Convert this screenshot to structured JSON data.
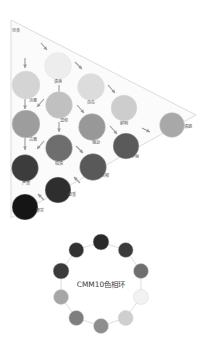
{
  "tone_triangle": {
    "apex_label": "轻柔",
    "axis_note": "",
    "tones": [
      {
        "id": "qingshuang",
        "label": "清爽",
        "color": "#ededed",
        "cx": 58,
        "cy": 66,
        "r": 13.5,
        "lx": 58,
        "ly": 83
      },
      {
        "id": "dan-ya",
        "label": "淡雅",
        "color": "#d4d4d4",
        "cx": 26,
        "cy": 85,
        "r": 14.0,
        "lx": 33,
        "ly": 102
      },
      {
        "id": "zi-zai",
        "label": "自在",
        "color": "#dcdcdc",
        "cx": 91,
        "cy": 87,
        "r": 13.5,
        "lx": 91,
        "ly": 104
      },
      {
        "id": "wen-he",
        "label": "温和",
        "color": "#c0c0c0",
        "cx": 59,
        "cy": 105,
        "r": 13.5,
        "lx": 64,
        "ly": 122
      },
      {
        "id": "xian-ming",
        "label": "鲜明",
        "color": "#cdcdcd",
        "cx": 124,
        "cy": 108,
        "r": 13.0,
        "lx": 124,
        "ly": 125
      },
      {
        "id": "gu-ya",
        "label": "古雅",
        "color": "#9d9d9d",
        "cx": 26,
        "cy": 124,
        "r": 14.0,
        "lx": 33,
        "ly": 141
      },
      {
        "id": "qiang-lie",
        "label": "强劲",
        "color": "#989898",
        "cx": 92,
        "cy": 127,
        "r": 13.5,
        "lx": 96,
        "ly": 144
      },
      {
        "id": "qing-lang",
        "label": "清朗",
        "color": "#a8a8a8",
        "cx": 172,
        "cy": 125,
        "r": 12.5,
        "lx": 188,
        "ly": 128
      },
      {
        "id": "an-qing",
        "label": "暗清",
        "color": "#6e6e6e",
        "cx": 59,
        "cy": 148,
        "r": 13.5,
        "lx": 59,
        "ly": 165
      },
      {
        "id": "hua-li",
        "label": "华丽",
        "color": "#5a5a5a",
        "cx": 126,
        "cy": 146,
        "r": 13.0,
        "lx": 135,
        "ly": 158
      },
      {
        "id": "yan-su",
        "label": "严肃",
        "color": "#3c3c3c",
        "cx": 25,
        "cy": 168,
        "r": 13.5,
        "lx": 26,
        "ly": 185
      },
      {
        "id": "nong-yu",
        "label": "浓郁",
        "color": "#595959",
        "cx": 93,
        "cy": 167,
        "r": 13.5,
        "lx": 105,
        "ly": 177
      },
      {
        "id": "wen-zhong",
        "label": "稳重",
        "color": "#2e2e2e",
        "cx": 58,
        "cy": 190,
        "r": 13.0,
        "lx": 72,
        "ly": 196
      },
      {
        "id": "hou-shi",
        "label": "厚实",
        "color": "#151515",
        "cx": 25,
        "cy": 207,
        "r": 13.0,
        "lx": 40,
        "ly": 212
      }
    ],
    "arrows": [
      {
        "x1": 25,
        "y1": 58,
        "x2": 25,
        "y2": 68
      },
      {
        "x1": 25,
        "y1": 98,
        "x2": 25,
        "y2": 109
      },
      {
        "x1": 25,
        "y1": 138,
        "x2": 25,
        "y2": 150
      },
      {
        "x1": 59,
        "y1": 85,
        "x2": 59,
        "y2": 96
      },
      {
        "x1": 59,
        "y1": 122,
        "x2": 59,
        "y2": 132
      },
      {
        "x1": 41,
        "y1": 43,
        "x2": 47,
        "y2": 50
      },
      {
        "x1": 75,
        "y1": 62,
        "x2": 82,
        "y2": 69
      },
      {
        "x1": 44,
        "y1": 99,
        "x2": 37,
        "y2": 107
      },
      {
        "x1": 108,
        "y1": 85,
        "x2": 115,
        "y2": 93
      },
      {
        "x1": 77,
        "y1": 105,
        "x2": 84,
        "y2": 113
      },
      {
        "x1": 44,
        "y1": 141,
        "x2": 37,
        "y2": 149
      },
      {
        "x1": 110,
        "y1": 126,
        "x2": 117,
        "y2": 134
      },
      {
        "x1": 76,
        "y1": 146,
        "x2": 83,
        "y2": 153
      },
      {
        "x1": 142,
        "y1": 128,
        "x2": 150,
        "y2": 132
      },
      {
        "x1": 80,
        "y1": 183,
        "x2": 74,
        "y2": 177
      },
      {
        "x1": 44,
        "y1": 200,
        "x2": 38,
        "y2": 194
      }
    ]
  },
  "hue_circle": {
    "title": "CMM10色相环",
    "center": {
      "cx": 101,
      "cy": 284,
      "r": 42
    },
    "dots": [
      {
        "id": "hue-1",
        "color": "#2a2a2a",
        "angle": -90,
        "r": 8.0
      },
      {
        "id": "hue-2",
        "color": "#3b3b3b",
        "angle": -54,
        "r": 7.5
      },
      {
        "id": "hue-3",
        "color": "#6f6f6f",
        "angle": -18,
        "r": 7.5
      },
      {
        "id": "hue-4",
        "color": "#f2f2f2",
        "angle": 18,
        "r": 7.5
      },
      {
        "id": "hue-5",
        "color": "#cfcfcf",
        "angle": 54,
        "r": 7.5
      },
      {
        "id": "hue-6",
        "color": "#8e8e8e",
        "angle": 90,
        "r": 7.5
      },
      {
        "id": "hue-7",
        "color": "#7e7e7e",
        "angle": 126,
        "r": 7.5
      },
      {
        "id": "hue-8",
        "color": "#a6a6a6",
        "angle": 162,
        "r": 7.5
      },
      {
        "id": "hue-9",
        "color": "#3a3a3a",
        "angle": 198,
        "r": 8.0
      },
      {
        "id": "hue-10",
        "color": "#323232",
        "angle": 234,
        "r": 7.5
      }
    ]
  },
  "watermark": ""
}
